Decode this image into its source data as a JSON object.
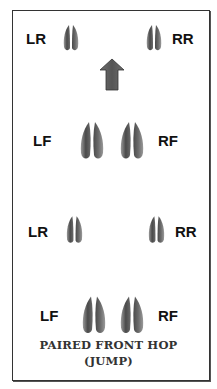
{
  "diagram": {
    "caption_line1": "PAIRED FRONT HOP",
    "caption_line2": "(JUMP)",
    "direction_arrow": "up",
    "rows": [
      {
        "left_label": "LR",
        "right_label": "RR",
        "type": "rear"
      },
      {
        "left_label": "LF",
        "right_label": "RF",
        "type": "front"
      },
      {
        "left_label": "LR",
        "right_label": "RR",
        "type": "rear"
      },
      {
        "left_label": "LF",
        "right_label": "RF",
        "type": "front"
      }
    ]
  },
  "colors": {
    "print_fill": "#5a5a5a",
    "print_shade": "#8a8a8a",
    "arrow_fill": "#5c5c5c",
    "border": "#333333",
    "text": "#111111"
  }
}
